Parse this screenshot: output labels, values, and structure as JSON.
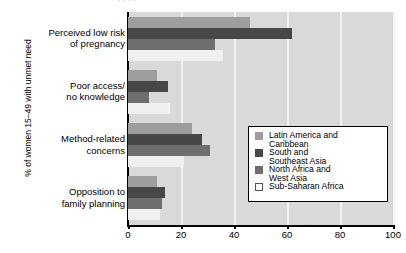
{
  "top_cropped_text": "· · ·   ·",
  "axes": {
    "ylabel": "% of women 15–49 with unmet need",
    "xticks": [
      "0",
      "20",
      "40",
      "60",
      "80",
      "100"
    ]
  },
  "legend": {
    "items": [
      {
        "label_line1": "Latin America and",
        "label_line2": "Caribbean",
        "color": "#9e9e9e",
        "swatch": "legend-swatch-latin-america"
      },
      {
        "label_line1": "South and",
        "label_line2": "Southeast Asia",
        "color": "#474747",
        "swatch": "legend-swatch-south-southeast-asia"
      },
      {
        "label_line1": "North Africa and",
        "label_line2": "West Asia",
        "color": "#6e6e6e",
        "swatch": "legend-swatch-north-africa-west-asia"
      },
      {
        "label_line1": "Sub-Saharan Africa",
        "label_line2": "",
        "color": "#ffffff",
        "swatch": "legend-swatch-sub-saharan-africa"
      }
    ]
  },
  "categories": [
    {
      "line1": "Perceived low risk",
      "line2": "of pregnancy"
    },
    {
      "line1": "Poor access/",
      "line2": "no knowledge"
    },
    {
      "line1": "Method-related",
      "line2": "concerns"
    },
    {
      "line1": "Opposition to",
      "line2": "family planning"
    }
  ],
  "chart_data": {
    "type": "bar",
    "orientation": "horizontal",
    "title": "",
    "xlabel": "",
    "ylabel": "% of women 15–49 with unmet need",
    "xlim": [
      0,
      100
    ],
    "xticks": [
      0,
      20,
      40,
      60,
      80,
      100
    ],
    "grid": true,
    "grid_axis": "x",
    "legend_position": "center-right",
    "categories": [
      "Perceived low risk of pregnancy",
      "Poor access/ no knowledge",
      "Method-related concerns",
      "Opposition to family planning"
    ],
    "series": [
      {
        "name": "Latin America and Caribbean",
        "color": "#9e9e9e",
        "values": [
          46,
          11,
          24,
          11
        ]
      },
      {
        "name": "South and Southeast Asia",
        "color": "#474747",
        "values": [
          62,
          15,
          28,
          14
        ]
      },
      {
        "name": "North Africa and West Asia",
        "color": "#6e6e6e",
        "values": [
          33,
          8,
          31,
          13
        ]
      },
      {
        "name": "Sub-Saharan Africa",
        "color": "#f0f0f0",
        "values": [
          36,
          16,
          21,
          12
        ]
      }
    ]
  }
}
